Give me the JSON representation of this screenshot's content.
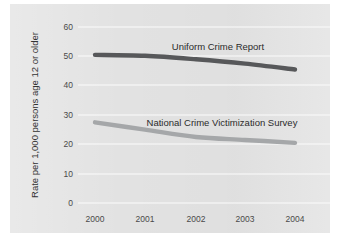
{
  "chart_data": {
    "type": "line",
    "title": "",
    "subtitle": "",
    "xlabel": "",
    "ylabel": "Rate per 1,000 persons age 12 or older",
    "x": [
      2000,
      2001,
      2002,
      2003,
      2004
    ],
    "categories": [
      "2000",
      "2001",
      "2002",
      "2003",
      "2004"
    ],
    "xtick_labels": [
      "2000",
      "2001",
      "2002",
      "2003",
      "2004"
    ],
    "ytick_labels": [
      "0",
      "10",
      "20",
      "30",
      "40",
      "50",
      "60"
    ],
    "yticks": [
      0,
      10,
      20,
      30,
      40,
      50,
      60
    ],
    "ylim": [
      0,
      60
    ],
    "xlim": [
      2000,
      2004
    ],
    "grid": "horizontal",
    "legend_position": "inline-labels",
    "series": [
      {
        "name": "Uniform Crime Report",
        "label": "Uniform Crime Report",
        "color": "#57585a",
        "values": [
          50.5,
          50.2,
          49.0,
          47.5,
          45.5
        ]
      },
      {
        "name": "National Crime Victimization Survey",
        "label": "National Crime Victimization Survey",
        "color": "#a5a7a9",
        "values": [
          27.5,
          25.0,
          22.5,
          21.5,
          20.5
        ]
      }
    ]
  },
  "axes": {
    "y_title": "Rate per 1,000 persons age 12 or older",
    "y_labels": {
      "t0": "0",
      "t10": "10",
      "t20": "20",
      "t30": "30",
      "t40": "40",
      "t50": "50",
      "t60": "60"
    },
    "x_labels": {
      "t2000": "2000",
      "t2001": "2001",
      "t2002": "2002",
      "t2003": "2003",
      "t2004": "2004"
    }
  },
  "annotations": {
    "ucr_label": "Uniform Crime Report",
    "ncvs_label": "National Crime Victimization Survey"
  },
  "colors": {
    "plate": "#e2e2e2",
    "gridline": "#fbfbfb",
    "ucr": "#57585a",
    "ncvs": "#a5a7a9",
    "text": "#3a3a3a"
  }
}
